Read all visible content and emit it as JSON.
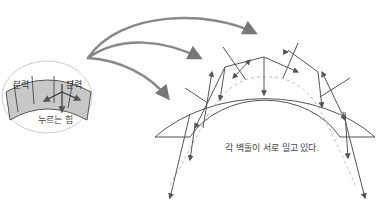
{
  "diagram": {
    "type": "arch-force-diagram",
    "labels": {
      "inset_left_force": "분력",
      "inset_right_force": "분력",
      "inset_press": "누르는 힘",
      "caption": "각 벽돌이 서로 밀고 있다."
    },
    "colors": {
      "stroke": "#555555",
      "stone_fill": "#c8c8c8",
      "arrow_gray": "#777777",
      "dashed": "#bbbbbb",
      "oval_stroke": "#cccccc",
      "text": "#444444"
    }
  }
}
